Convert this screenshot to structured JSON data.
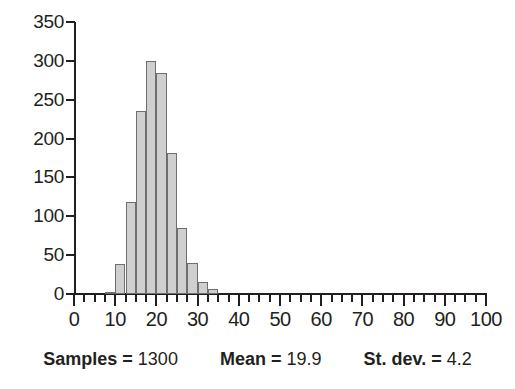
{
  "chart_data": {
    "type": "bar",
    "title": "",
    "subtitle": "",
    "xlabel": "",
    "ylabel": "",
    "xlim": [
      0,
      100
    ],
    "ylim": [
      0,
      350
    ],
    "grid": false,
    "legend": null,
    "bin_width": 2.5,
    "bar_color": "#cfcfcf",
    "bar_edge_color": "#6e6e6e",
    "x_ticks": [
      0,
      10,
      20,
      30,
      40,
      50,
      60,
      70,
      80,
      90,
      100
    ],
    "x_tick_labels": [
      "0",
      "10",
      "20",
      "30",
      "40",
      "50",
      "60",
      "70",
      "80",
      "90",
      "100"
    ],
    "x_minor_tick_step": 2.5,
    "y_ticks": [
      0,
      50,
      100,
      150,
      200,
      250,
      300,
      350
    ],
    "y_tick_labels": [
      "0",
      "50",
      "100",
      "150",
      "200",
      "250",
      "300",
      "350"
    ],
    "bin_starts": [
      7.5,
      10.0,
      12.5,
      15.0,
      17.5,
      20.0,
      22.5,
      25.0,
      27.5,
      30.0,
      32.5
    ],
    "bin_centers": [
      8.75,
      11.25,
      13.75,
      16.25,
      18.75,
      21.25,
      23.75,
      26.25,
      28.75,
      31.25,
      33.75
    ],
    "categories": [
      "7.5-10",
      "10-12.5",
      "12.5-15",
      "15-17.5",
      "17.5-20",
      "20-22.5",
      "22.5-25",
      "25-27.5",
      "27.5-30",
      "30-32.5",
      "32.5-35"
    ],
    "values": [
      3,
      38,
      119,
      236,
      300,
      284,
      182,
      85,
      40,
      16,
      6
    ]
  },
  "caption": {
    "items": [
      {
        "key": "Samples",
        "eq": "=",
        "value": "1300"
      },
      {
        "key": "Mean",
        "eq": "=",
        "value": "19.9"
      },
      {
        "key": "St. dev.",
        "eq": "=",
        "value": "4.2"
      }
    ]
  }
}
